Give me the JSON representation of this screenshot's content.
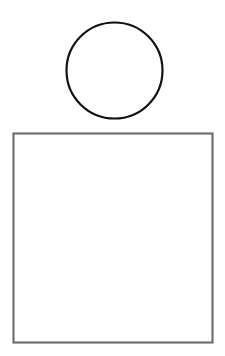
{
  "canvas": {
    "width": 225,
    "height": 356,
    "background": "#ffffff"
  },
  "shapes": {
    "circle": {
      "cx": 114.5,
      "cy": 70.5,
      "r": 48,
      "stroke": "#111111",
      "stroke_width": 2.2,
      "fill": "#ffffff"
    },
    "square": {
      "x": 13.5,
      "y": 133.5,
      "width": 199,
      "height": 209,
      "stroke": "#707070",
      "stroke_width": 2.2,
      "fill": "#ffffff"
    }
  }
}
